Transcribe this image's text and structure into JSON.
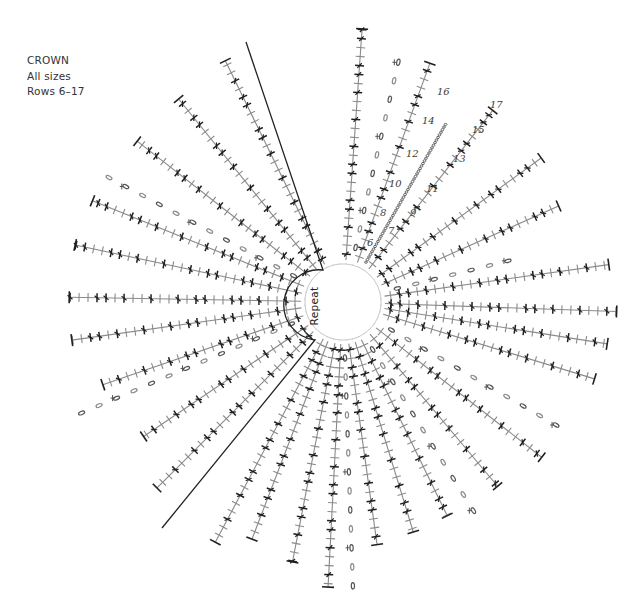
{
  "caption": {
    "title": "CROWN",
    "sizes": "All sizes",
    "rows": "Rows 6–17"
  },
  "diagram": {
    "type": "crochet-round-chart",
    "center": [
      343,
      302
    ],
    "inner_radius": 38,
    "repeat_label": "Repeat",
    "repeat_arc": {
      "radius": 35,
      "start_deg": 235,
      "end_deg": 125
    },
    "repeat_boundaries": [
      {
        "from": [
          323,
          270
        ],
        "to": [
          246,
          42
        ]
      },
      {
        "from": [
          315,
          340
        ],
        "to": [
          162,
          528
        ]
      }
    ],
    "colors": {
      "dark_stitch": "#1f1f1f",
      "light_stitch": "#8a8a8a",
      "faint_stitch": "#c8c8c8",
      "line": "#222222",
      "chain": "#555555"
    },
    "spokes": [
      {
        "angle": -86,
        "length": 262,
        "kind": "stitch"
      },
      {
        "angle": -77,
        "length": 238,
        "kind": "chain-dots"
      },
      {
        "angle": -70,
        "length": 240,
        "kind": "stitch"
      },
      {
        "angle": -60,
        "length": 186,
        "kind": "chain-line"
      },
      {
        "angle": -52,
        "length": 228,
        "kind": "stitch"
      },
      {
        "angle": -36,
        "length": 230,
        "kind": "stitch"
      },
      {
        "angle": -24,
        "length": 220,
        "kind": "stitch"
      },
      {
        "angle": -14,
        "length": 165,
        "kind": "chain-dots"
      },
      {
        "angle": -8,
        "length": 256,
        "kind": "stitch"
      },
      {
        "angle": 2,
        "length": 262,
        "kind": "stitch"
      },
      {
        "angle": 9,
        "length": 255,
        "kind": "stitch"
      },
      {
        "angle": 17,
        "length": 250,
        "kind": "stitch"
      },
      {
        "angle": 30,
        "length": 232,
        "kind": "chain-dots"
      },
      {
        "angle": 38,
        "length": 238,
        "kind": "stitch"
      },
      {
        "angle": 50,
        "length": 225,
        "kind": "stitch"
      },
      {
        "angle": 58,
        "length": 232,
        "kind": "chain-dots"
      },
      {
        "angle": 64,
        "length": 222,
        "kind": "stitch"
      },
      {
        "angle": 73,
        "length": 225,
        "kind": "stitch"
      },
      {
        "angle": 82,
        "length": 230,
        "kind": "stitch"
      },
      {
        "angle": 88,
        "length": 275,
        "kind": "chain-dots"
      },
      {
        "angle": 93,
        "length": 275,
        "kind": "stitch"
      },
      {
        "angle": 101,
        "length": 252,
        "kind": "stitch"
      },
      {
        "angle": 111,
        "length": 240,
        "kind": "stitch"
      },
      {
        "angle": 118,
        "length": 260,
        "kind": "stitch"
      },
      {
        "angle": 135,
        "length": 250,
        "kind": "stitch"
      },
      {
        "angle": 146,
        "length": 225,
        "kind": "stitch"
      },
      {
        "angle": 157,
        "length": 280,
        "kind": "chain-dots"
      },
      {
        "angle": 161,
        "length": 240,
        "kind": "stitch"
      },
      {
        "angle": 172,
        "length": 262,
        "kind": "stitch"
      },
      {
        "angle": 181,
        "length": 262,
        "kind": "stitch"
      },
      {
        "angle": 192,
        "length": 262,
        "kind": "stitch"
      },
      {
        "angle": 202,
        "length": 258,
        "kind": "stitch"
      },
      {
        "angle": 208,
        "length": 260,
        "kind": "chain-dots"
      },
      {
        "angle": 218,
        "length": 248,
        "kind": "stitch"
      },
      {
        "angle": 231,
        "length": 248,
        "kind": "stitch"
      },
      {
        "angle": 244,
        "length": 256,
        "kind": "stitch"
      }
    ],
    "row_labels": [
      {
        "text": "6",
        "x": 367,
        "y": 246
      },
      {
        "text": "7",
        "x": 388,
        "y": 234
      },
      {
        "text": "8",
        "x": 380,
        "y": 216
      },
      {
        "text": "9",
        "x": 410,
        "y": 216
      },
      {
        "text": "10",
        "x": 389,
        "y": 187
      },
      {
        "text": "11",
        "x": 426,
        "y": 192
      },
      {
        "text": "12",
        "x": 406,
        "y": 157
      },
      {
        "text": "13",
        "x": 453,
        "y": 162
      },
      {
        "text": "14",
        "x": 422,
        "y": 124
      },
      {
        "text": "15",
        "x": 472,
        "y": 133
      },
      {
        "text": "16",
        "x": 437,
        "y": 95
      },
      {
        "text": "17",
        "x": 490,
        "y": 108
      }
    ]
  }
}
